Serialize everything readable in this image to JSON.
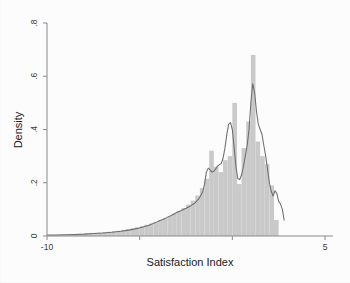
{
  "chart_data": {
    "type": "bar",
    "title": "",
    "subtitle": "",
    "xlabel": "Satisfaction Index",
    "ylabel": "Density",
    "xlim": [
      -10,
      5
    ],
    "ylim": [
      0,
      0.8
    ],
    "grid": false,
    "legend": null,
    "x_ticks": [
      -10,
      -5,
      0,
      5
    ],
    "x_tick_labels": [
      "-10",
      "",
      "",
      "5"
    ],
    "y_ticks": [
      0,
      0.2,
      0.4,
      0.6,
      0.8
    ],
    "y_tick_labels": [
      "0",
      ".2",
      ".4",
      ".6",
      ".8"
    ],
    "bin_width": 0.25,
    "bar_color": "#c9c9c9",
    "density_color": "#6e6e6e",
    "series": [
      {
        "name": "Histogram (density)",
        "type": "bar",
        "bin_centers": [
          -9.875,
          -9.625,
          -9.375,
          -9.125,
          -8.875,
          -8.625,
          -8.375,
          -8.125,
          -7.875,
          -7.625,
          -7.375,
          -7.125,
          -6.875,
          -6.625,
          -6.375,
          -6.125,
          -5.875,
          -5.625,
          -5.375,
          -5.125,
          -4.875,
          -4.625,
          -4.375,
          -4.125,
          -3.875,
          -3.625,
          -3.375,
          -3.125,
          -2.875,
          -2.625,
          -2.375,
          -2.125,
          -1.875,
          -1.625,
          -1.375,
          -1.125,
          -0.875,
          -0.625,
          -0.375,
          -0.125,
          0.125,
          0.375,
          0.625,
          0.875,
          1.125,
          1.375,
          1.625,
          1.875,
          2.125,
          2.375,
          2.625,
          2.875
        ],
        "values": [
          0.004,
          0.004,
          0.005,
          0.005,
          0.006,
          0.006,
          0.007,
          0.008,
          0.009,
          0.01,
          0.011,
          0.013,
          0.014,
          0.016,
          0.018,
          0.02,
          0.023,
          0.026,
          0.029,
          0.033,
          0.037,
          0.042,
          0.047,
          0.053,
          0.06,
          0.067,
          0.075,
          0.084,
          0.094,
          0.105,
          0.118,
          0.133,
          0.152,
          0.18,
          0.215,
          0.32,
          0.26,
          0.24,
          0.285,
          0.3,
          0.5,
          0.195,
          0.33,
          0.43,
          0.68,
          0.355,
          0.3,
          0.27,
          0.19,
          0.06,
          0.0,
          0.0
        ]
      },
      {
        "name": "Kernel density",
        "type": "line",
        "x": [
          -10.0,
          -9.5,
          -9.0,
          -8.5,
          -8.0,
          -7.5,
          -7.0,
          -6.5,
          -6.0,
          -5.5,
          -5.0,
          -4.5,
          -4.0,
          -3.75,
          -3.5,
          -3.25,
          -3.0,
          -2.75,
          -2.5,
          -2.25,
          -2.0,
          -1.8,
          -1.6,
          -1.5,
          -1.4,
          -1.3,
          -1.2,
          -1.1,
          -1.0,
          -0.9,
          -0.8,
          -0.7,
          -0.6,
          -0.5,
          -0.4,
          -0.3,
          -0.2,
          -0.1,
          0.0,
          0.1,
          0.2,
          0.3,
          0.4,
          0.5,
          0.6,
          0.7,
          0.8,
          0.9,
          1.0,
          1.1,
          1.2,
          1.3,
          1.4,
          1.5,
          1.6,
          1.7,
          1.8,
          1.9,
          2.0,
          2.1,
          2.2,
          2.3,
          2.4,
          2.5,
          2.6,
          2.7,
          2.8
        ],
        "y": [
          0.004,
          0.004,
          0.005,
          0.006,
          0.007,
          0.009,
          0.011,
          0.014,
          0.018,
          0.023,
          0.03,
          0.04,
          0.055,
          0.062,
          0.07,
          0.079,
          0.088,
          0.096,
          0.104,
          0.113,
          0.125,
          0.14,
          0.165,
          0.195,
          0.24,
          0.255,
          0.248,
          0.24,
          0.243,
          0.252,
          0.262,
          0.268,
          0.272,
          0.292,
          0.33,
          0.38,
          0.42,
          0.426,
          0.4,
          0.33,
          0.258,
          0.215,
          0.212,
          0.23,
          0.262,
          0.3,
          0.34,
          0.4,
          0.5,
          0.572,
          0.54,
          0.47,
          0.42,
          0.4,
          0.382,
          0.34,
          0.3,
          0.25,
          0.2,
          0.168,
          0.15,
          0.17,
          0.16,
          0.13,
          0.12,
          0.1,
          0.058
        ]
      }
    ]
  }
}
